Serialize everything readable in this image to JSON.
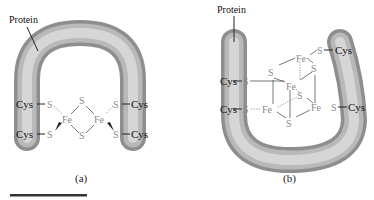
{
  "panel_a": {
    "protein_label": "Protein",
    "caption": "(a)",
    "cys": [
      "Cys",
      "Cys",
      "Cys",
      "Cys"
    ],
    "s_terminal": [
      "S",
      "S",
      "S",
      "S"
    ],
    "s_bridge": [
      "S",
      "S"
    ],
    "fe": [
      "Fe",
      "Fe"
    ]
  },
  "panel_b": {
    "protein_label": "Protein",
    "caption": "(b)",
    "cys": [
      "Cys",
      "Cys",
      "Cys",
      "Cys"
    ],
    "s_terminal": [
      "S",
      "S",
      "S",
      "S"
    ],
    "s_cube": [
      "S",
      "S",
      "S",
      "S"
    ],
    "fe": [
      "Fe",
      "Fe",
      "Fe",
      "Fe"
    ]
  },
  "colors": {
    "protein_light": "#d8d8d8",
    "protein_dark": "#8c8c8c",
    "scale_bar": "#333333"
  }
}
